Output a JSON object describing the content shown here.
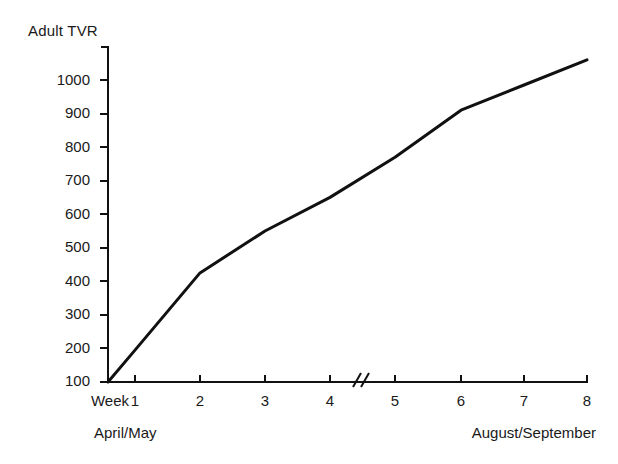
{
  "chart_data": {
    "type": "line",
    "title": "Adult TVR",
    "xlabel": "Week",
    "ylabel": "Adult TVR",
    "x": [
      0,
      1,
      2,
      3,
      4,
      5,
      6,
      7,
      8
    ],
    "values": [
      100,
      195,
      425,
      550,
      650,
      770,
      910,
      985,
      1060
    ],
    "x_tick_labels": [
      "Week",
      "1",
      "2",
      "3",
      "4",
      "5",
      "6",
      "7",
      "8"
    ],
    "y_tick_labels": [
      "100",
      "200",
      "300",
      "400",
      "500",
      "600",
      "700",
      "800",
      "900",
      "1000"
    ],
    "y_tick_values": [
      100,
      200,
      300,
      400,
      500,
      600,
      700,
      800,
      900,
      1000
    ],
    "ylim": [
      100,
      1100
    ],
    "xlim": [
      0,
      8
    ],
    "grid": false,
    "legend": null,
    "axis_break": {
      "between": [
        4,
        5
      ],
      "symbol": "//"
    },
    "period_labels": [
      {
        "text": "April/May",
        "position": "left"
      },
      {
        "text": "August/September",
        "position": "right"
      }
    ],
    "line_color": "#111111",
    "axis_color": "#111111"
  }
}
